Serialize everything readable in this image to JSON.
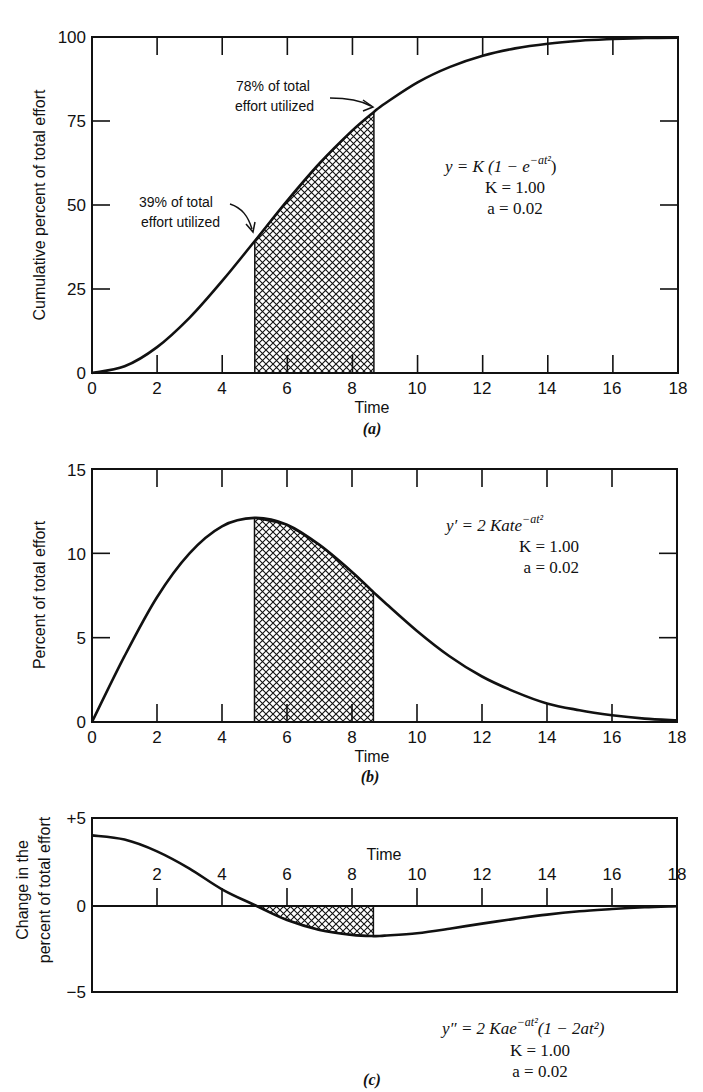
{
  "chart_data": [
    {
      "id": "a",
      "type": "line",
      "panel_label": "(a)",
      "title": "",
      "xlabel": "Time",
      "ylabel": "Cumulative percent of total effort",
      "xlim": [
        0,
        18
      ],
      "ylim": [
        0,
        100
      ],
      "x_ticks": [
        "0",
        "2",
        "4",
        "6",
        "8",
        "10",
        "12",
        "14",
        "16",
        "18"
      ],
      "y_ticks": [
        "0",
        "25",
        "50",
        "75",
        "100"
      ],
      "grid": false,
      "formula": {
        "line1": "y = K (1 − e",
        "line1_sup": "−at²",
        "line1_end": ")",
        "line2": "K = 1.00",
        "line3": "a = 0.02"
      },
      "shaded_region": {
        "x_start": 5.0,
        "x_end": 8.66,
        "pattern": "crosshatch"
      },
      "annotations": [
        {
          "text_line1": "39% of total",
          "text_line2": "effort utilized",
          "x": 5.0,
          "y": 39
        },
        {
          "text_line1": "78% of total",
          "text_line2": "effort utilized",
          "x": 8.66,
          "y": 78
        }
      ],
      "series": [
        {
          "name": "y = K(1 − e^(−at²))",
          "x": [
            0,
            1,
            2,
            3,
            4,
            5,
            6,
            7,
            8,
            8.66,
            9,
            10,
            11,
            12,
            13,
            14,
            15,
            16,
            17,
            18
          ],
          "values": [
            0,
            2.0,
            7.7,
            16.5,
            27.4,
            39.3,
            51.3,
            62.5,
            72.2,
            77.7,
            80.2,
            86.5,
            91.1,
            94.4,
            96.6,
            98.0,
            98.9,
            99.4,
            99.7,
            99.8
          ]
        }
      ]
    },
    {
      "id": "b",
      "type": "line",
      "panel_label": "(b)",
      "title": "",
      "xlabel": "Time",
      "ylabel": "Percent of total effort",
      "xlim": [
        0,
        18
      ],
      "ylim": [
        0,
        15
      ],
      "x_ticks": [
        "0",
        "2",
        "4",
        "6",
        "8",
        "10",
        "12",
        "14",
        "16",
        "18"
      ],
      "y_ticks": [
        "0",
        "5",
        "10",
        "15"
      ],
      "grid": false,
      "formula": {
        "line1": "y′ = 2 Kate",
        "line1_sup": "−at²",
        "line1_end": "",
        "line2": "K = 1.00",
        "line3": "a = 0.02"
      },
      "shaded_region": {
        "x_start": 5.0,
        "x_end": 8.66,
        "pattern": "crosshatch"
      },
      "series": [
        {
          "name": "y′ = 2Kate^(−at²)",
          "x": [
            0,
            1,
            2,
            3,
            4,
            5,
            6,
            7,
            8,
            8.66,
            9,
            10,
            11,
            12,
            13,
            14,
            15,
            16,
            17,
            18
          ],
          "values": [
            0,
            3.9,
            7.4,
            10.0,
            11.6,
            12.1,
            11.7,
            10.5,
            8.9,
            7.7,
            7.1,
            5.4,
            3.9,
            2.7,
            1.8,
            1.1,
            0.7,
            0.4,
            0.2,
            0.1
          ]
        }
      ]
    },
    {
      "id": "c",
      "type": "line",
      "panel_label": "(c)",
      "title": "",
      "xlabel": "Time",
      "ylabel": "Change in the percent of total effort",
      "ylabel_line1": "Change in the",
      "ylabel_line2": "percent of total effort",
      "xlim": [
        0,
        18
      ],
      "ylim": [
        -5,
        5
      ],
      "x_ticks": [
        "2",
        "4",
        "6",
        "8",
        "10",
        "12",
        "14",
        "16",
        "18"
      ],
      "y_ticks": [
        "−5",
        "0",
        "+5"
      ],
      "grid": false,
      "formula": {
        "line1": "y″ = 2 Kae",
        "line1_sup": "−at²",
        "line1_end": "(1 − 2at²)",
        "line2": "K = 1.00",
        "line3": "a = 0.02"
      },
      "shaded_region": {
        "x_start": 5.0,
        "x_end": 8.66,
        "pattern": "crosshatch"
      },
      "series": [
        {
          "name": "y″ = 2Kae^(−at²)(1 − 2at²)",
          "x": [
            0,
            1,
            2,
            3,
            4,
            5,
            6,
            7,
            8,
            8.66,
            9,
            10,
            11,
            12,
            13,
            14,
            15,
            16,
            17,
            18
          ],
          "values": [
            4.0,
            3.76,
            3.08,
            2.09,
            0.9,
            0.0,
            -0.86,
            -1.43,
            -1.72,
            -1.79,
            -1.76,
            -1.62,
            -1.36,
            -1.07,
            -0.8,
            -0.55,
            -0.36,
            -0.23,
            -0.13,
            -0.07
          ]
        }
      ]
    }
  ]
}
